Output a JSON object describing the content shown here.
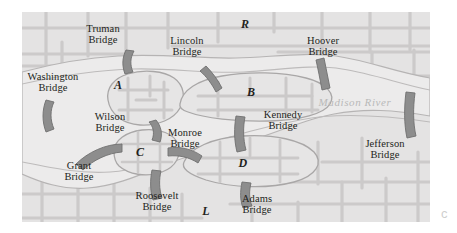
{
  "figure": {
    "kind": "map",
    "corner_mark": "c",
    "frame": {
      "x": 22,
      "y": 12,
      "width": 408,
      "height": 210
    }
  },
  "colors": {
    "land": "#e3e3e3",
    "land_dark": "#d6d6d6",
    "water": "#eceaea",
    "road": "#c9c9c9",
    "island_fill": "#eaeaea",
    "bridge": "#8d8d8d",
    "bridge_stroke": "#6f6f6f",
    "text": "#231f20",
    "river_text": "#b9b9b9",
    "outline": "#b0b0b0"
  },
  "river": {
    "name": "Madison River",
    "label_x": 300,
    "label_y": 108
  },
  "regions": [
    {
      "id": "A",
      "label": "A",
      "type": "island",
      "x": 118,
      "y": 92
    },
    {
      "id": "B",
      "label": "B",
      "type": "island",
      "x": 243,
      "y": 90
    },
    {
      "id": "C",
      "label": "C",
      "type": "island",
      "x": 129,
      "y": 148
    },
    {
      "id": "D",
      "label": "D",
      "type": "island",
      "x": 232,
      "y": 158
    },
    {
      "id": "R",
      "label": "R",
      "type": "bank-north",
      "x": 240,
      "y": 26
    },
    {
      "id": "L",
      "label": "L",
      "type": "bank-south",
      "x": 205,
      "y": 208
    }
  ],
  "bridges": [
    {
      "id": "truman",
      "name": "Truman Bridge",
      "lines": [
        "Truman",
        "Bridge"
      ],
      "label_x": 103,
      "label_y": 24,
      "connects": [
        "R",
        "A"
      ]
    },
    {
      "id": "lincoln",
      "name": "Lincoln Bridge",
      "lines": [
        "Lincoln",
        "Bridge"
      ],
      "label_x": 187,
      "label_y": 36,
      "connects": [
        "R",
        "B"
      ]
    },
    {
      "id": "hoover",
      "name": "Hoover Bridge",
      "lines": [
        "Hoover",
        "Bridge"
      ],
      "label_x": 323,
      "label_y": 36,
      "connects": [
        "R",
        "B"
      ]
    },
    {
      "id": "washington",
      "name": "Washington Bridge",
      "lines": [
        "Washington",
        "Bridge"
      ],
      "label_x": 53,
      "label_y": 72,
      "connects": [
        "L",
        "A"
      ]
    },
    {
      "id": "wilson",
      "name": "Wilson Bridge",
      "lines": [
        "Wilson",
        "Bridge"
      ],
      "label_x": 110,
      "label_y": 112,
      "connects": [
        "A",
        "C"
      ]
    },
    {
      "id": "kennedy",
      "name": "Kennedy Bridge",
      "lines": [
        "Kennedy",
        "Bridge"
      ],
      "label_x": 283,
      "label_y": 112,
      "connects": [
        "B",
        "D"
      ]
    },
    {
      "id": "monroe",
      "name": "Monroe Bridge",
      "lines": [
        "Monroe",
        "Bridge"
      ],
      "label_x": 185,
      "label_y": 131,
      "connects": [
        "C",
        "D"
      ]
    },
    {
      "id": "grant",
      "name": "Grant Bridge",
      "lines": [
        "Grant",
        "Bridge"
      ],
      "label_x": 79,
      "label_y": 163,
      "connects": [
        "L",
        "C"
      ]
    },
    {
      "id": "roosevelt",
      "name": "Roosevelt Bridge",
      "lines": [
        "Roosevelt",
        "Bridge"
      ],
      "label_x": 157,
      "label_y": 191,
      "connects": [
        "L",
        "C"
      ]
    },
    {
      "id": "adams",
      "name": "Adams Bridge",
      "lines": [
        "Adams",
        "Bridge"
      ],
      "label_x": 257,
      "label_y": 196,
      "connects": [
        "L",
        "D"
      ]
    },
    {
      "id": "jefferson",
      "name": "Jefferson Bridge",
      "lines": [
        "Jefferson",
        "Bridge"
      ],
      "label_x": 385,
      "label_y": 140,
      "connects": [
        "R",
        "L"
      ]
    }
  ]
}
